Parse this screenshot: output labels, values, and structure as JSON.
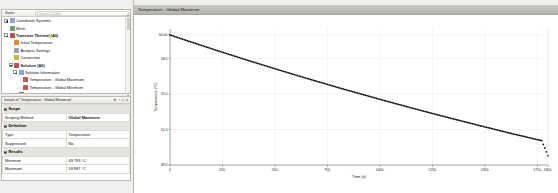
{
  "window": {
    "background": "#f3f3f1"
  },
  "tree": {
    "header": {
      "name_col": "Name",
      "filter_placeholder": "Search Outline"
    },
    "items": [
      {
        "label": "Coordinate Systems",
        "depth": 1,
        "expander": "plus",
        "icon": "coordinate-systems-icon",
        "icon_color": "#8aa6c8",
        "bold": false
      },
      {
        "label": "Mesh",
        "depth": 1,
        "expander": "none",
        "icon": "mesh-icon",
        "icon_color": "#6f9a6f",
        "bold": false
      },
      {
        "label": "Transient Thermal (A5)",
        "depth": 1,
        "expander": "minus",
        "icon": "transient-thermal-icon",
        "icon_color": "#c0504d",
        "bold": true
      },
      {
        "label": "Initial Temperature",
        "depth": 2,
        "expander": "none",
        "icon": "initial-temperature-icon",
        "icon_color": "#d98a3a",
        "bold": false
      },
      {
        "label": "Analysis Settings",
        "depth": 2,
        "expander": "none",
        "icon": "analysis-settings-icon",
        "icon_color": "#9aa3ad",
        "bold": false
      },
      {
        "label": "Convection",
        "depth": 2,
        "expander": "none",
        "icon": "convection-icon",
        "icon_color": "#d4b23c",
        "bold": false
      },
      {
        "label": "Solution (A6)",
        "depth": 2,
        "expander": "minus",
        "icon": "solution-icon",
        "icon_color": "#c0504d",
        "bold": true
      },
      {
        "label": "Solution Information",
        "depth": 3,
        "expander": "minus",
        "icon": "solution-information-icon",
        "icon_color": "#7fa8d0",
        "bold": false
      },
      {
        "label": "Temperature - Global Maximum",
        "depth": 4,
        "expander": "none",
        "icon": "result-probe-icon",
        "icon_color": "#b85c5c",
        "bold": false
      },
      {
        "label": "Temperature - Global Minimum",
        "depth": 4,
        "expander": "none",
        "icon": "result-probe-icon",
        "icon_color": "#b85c5c",
        "bold": false
      },
      {
        "label": "Temperature",
        "depth": 3,
        "expander": "none",
        "icon": "temperature-result-icon",
        "icon_color": "#b85c5c",
        "bold": false
      }
    ]
  },
  "details": {
    "title": "Details of \"Temperature - Global Maximum\"",
    "buttons": [
      "pin-icon",
      "minimize-icon",
      "maximize-icon",
      "close-icon"
    ],
    "rows": [
      {
        "kind": "section",
        "label": "Scope"
      },
      {
        "kind": "row",
        "key": "Scoping Method",
        "value": "Global Maximum",
        "bold_value": true
      },
      {
        "kind": "section",
        "label": "Definition"
      },
      {
        "kind": "row",
        "key": "Type",
        "value": "Temperature",
        "bold_value": false
      },
      {
        "kind": "row",
        "key": "Suppressed",
        "value": "No",
        "bold_value": false
      },
      {
        "kind": "section",
        "label": "Results"
      },
      {
        "kind": "row",
        "key": "Minimum",
        "value": "49.793 °C",
        "bold_value": false,
        "indent": true
      },
      {
        "kind": "row",
        "key": "Maximum",
        "value": "59.997 °C",
        "bold_value": false,
        "indent": true
      }
    ]
  },
  "chart": {
    "title": "Temperature - Global Maximum"
  },
  "chart_data": {
    "type": "line",
    "title": "Temperature - Global Maximum",
    "xlabel": "Time (s)",
    "ylabel": "Temperature (°C)",
    "xlim": [
      0,
      1800
    ],
    "ylim": [
      49.0,
      60.5
    ],
    "xticks": [
      0,
      250,
      500,
      750,
      1000,
      1250,
      1500,
      1750,
      1800
    ],
    "xticklabels": [
      "0",
      "250.",
      "500.",
      "750.",
      "1000.",
      "1250.",
      "1500.",
      "1750.",
      "1800."
    ],
    "yticks": [
      49.0,
      52.0,
      55.0,
      58.0,
      60.0
    ],
    "yticklabels": [
      "49.0",
      "52.0",
      "55.0",
      "58.0",
      "60.00"
    ],
    "grid": true,
    "legend": "none",
    "marker": "square",
    "series": [
      {
        "name": "Temperature - Global Maximum",
        "color": "#000000",
        "x": [
          0,
          30,
          60,
          90,
          120,
          150,
          180,
          210,
          240,
          270,
          300,
          330,
          360,
          390,
          420,
          450,
          480,
          510,
          540,
          570,
          600,
          630,
          660,
          690,
          720,
          750,
          780,
          810,
          840,
          870,
          900,
          930,
          960,
          990,
          1020,
          1050,
          1080,
          1110,
          1140,
          1170,
          1200,
          1230,
          1260,
          1290,
          1320,
          1350,
          1380,
          1410,
          1440,
          1470,
          1500,
          1530,
          1560,
          1590,
          1620,
          1650,
          1680,
          1710,
          1740,
          1770,
          1800
        ],
        "y": [
          59.997,
          59.82,
          59.64,
          59.46,
          59.29,
          59.11,
          58.94,
          58.76,
          58.59,
          58.42,
          58.25,
          58.08,
          57.91,
          57.74,
          57.58,
          57.41,
          57.25,
          57.08,
          56.92,
          56.76,
          56.6,
          56.44,
          56.28,
          56.12,
          55.97,
          55.81,
          55.66,
          55.5,
          55.35,
          55.2,
          55.05,
          54.9,
          54.75,
          54.6,
          54.45,
          54.31,
          54.16,
          54.02,
          53.87,
          53.73,
          53.59,
          53.45,
          53.31,
          53.17,
          53.03,
          52.89,
          52.76,
          52.62,
          52.49,
          52.35,
          52.22,
          52.09,
          51.95,
          51.82,
          51.69,
          51.56,
          51.44,
          51.31,
          51.18,
          51.06,
          49.793
        ]
      }
    ]
  }
}
